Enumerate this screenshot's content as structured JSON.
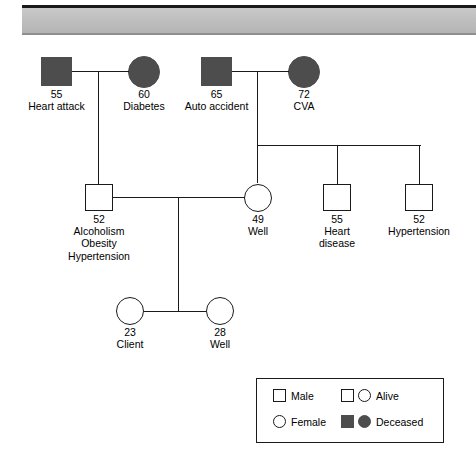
{
  "banner": {
    "accent_color": "#bdbdbd",
    "rule_color": "#1a1a1a"
  },
  "diagram": {
    "fill_deceased_color": "#4d4d4d",
    "line_color": "#1a1a1a"
  },
  "generation1": {
    "people": [
      {
        "id": "g1-paternal-grandfather",
        "shape": "square",
        "sex": "Male",
        "status": "Deceased",
        "age": "55",
        "notes": [
          "Heart attack"
        ]
      },
      {
        "id": "g1-paternal-grandmother",
        "shape": "circle",
        "sex": "Female",
        "status": "Deceased",
        "age": "60",
        "notes": [
          "Diabetes"
        ]
      },
      {
        "id": "g1-maternal-grandfather",
        "shape": "square",
        "sex": "Male",
        "status": "Deceased",
        "age": "65",
        "notes": [
          "Auto accident"
        ]
      },
      {
        "id": "g1-maternal-grandmother",
        "shape": "circle",
        "sex": "Female",
        "status": "Deceased",
        "age": "72",
        "notes": [
          "CVA"
        ]
      }
    ]
  },
  "generation2": {
    "people": [
      {
        "id": "g2-father",
        "shape": "square",
        "sex": "Male",
        "status": "Alive",
        "age": "52",
        "notes": [
          "Alcoholism",
          "Obesity",
          "Hypertension"
        ]
      },
      {
        "id": "g2-mother",
        "shape": "circle",
        "sex": "Female",
        "status": "Alive",
        "age": "49",
        "notes": [
          "Well"
        ]
      },
      {
        "id": "g2-uncle-1",
        "shape": "square",
        "sex": "Male",
        "status": "Alive",
        "age": "55",
        "notes": [
          "Heart",
          "disease"
        ]
      },
      {
        "id": "g2-uncle-2",
        "shape": "square",
        "sex": "Male",
        "status": "Alive",
        "age": "52",
        "notes": [
          "Hypertension"
        ]
      }
    ]
  },
  "generation3": {
    "people": [
      {
        "id": "g3-client",
        "shape": "circle",
        "sex": "Female",
        "status": "Alive",
        "age": "23",
        "notes": [
          "Client"
        ]
      },
      {
        "id": "g3-sister",
        "shape": "circle",
        "sex": "Female",
        "status": "Alive",
        "age": "28",
        "notes": [
          "Well"
        ]
      }
    ]
  },
  "legend": {
    "items": [
      {
        "id": "legend-male",
        "label": "Male",
        "glyphs": [
          "square-outline"
        ]
      },
      {
        "id": "legend-female",
        "label": "Female",
        "glyphs": [
          "circle-outline"
        ]
      },
      {
        "id": "legend-alive",
        "label": "Alive",
        "glyphs": [
          "square-outline",
          "circle-outline"
        ]
      },
      {
        "id": "legend-deceased",
        "label": "Deceased",
        "glyphs": [
          "square-filled",
          "circle-filled"
        ]
      }
    ]
  }
}
